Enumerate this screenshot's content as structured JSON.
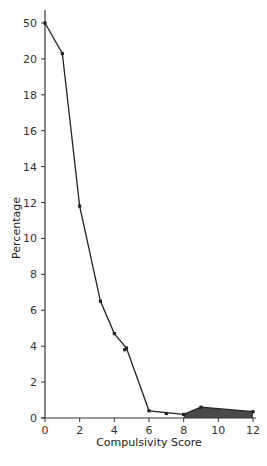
{
  "chart_data": {
    "type": "line",
    "title": "",
    "xlabel": "Compulsivity Score",
    "ylabel": "Percentage",
    "x_ticks": [
      "0",
      "2",
      "4",
      "6",
      "8",
      "10",
      "12"
    ],
    "y_ticks": [
      "0",
      "2",
      "4",
      "6",
      "8",
      "10",
      "12",
      "14",
      "16",
      "18",
      "20",
      "50"
    ],
    "y_axis_note": "broken axis: tick '50' placed one interval above '20'",
    "xlim": [
      0,
      12
    ],
    "ylim": [
      0,
      22
    ],
    "grid": false,
    "legend": null,
    "series": [
      {
        "name": "Percentage",
        "points": [
          {
            "x": 0,
            "y": 50,
            "plot_y": 22
          },
          {
            "x": 1,
            "y": 20.3
          },
          {
            "x": 2,
            "y": 11.8
          },
          {
            "x": 3.2,
            "y": 6.5
          },
          {
            "x": 4,
            "y": 4.7
          },
          {
            "x": 4.7,
            "y": 3.9
          },
          {
            "x": 6,
            "y": 0.4
          },
          {
            "x": 8,
            "y": 0.2
          },
          {
            "x": 9,
            "y": 0.6
          },
          {
            "x": 12,
            "y": 0.35
          }
        ]
      }
    ],
    "extra_markers": [
      {
        "x": 7,
        "y": 0.25
      },
      {
        "x": 4.6,
        "y": 3.8
      }
    ],
    "shaded_region": {
      "x_from": 8,
      "x_to": 12,
      "color": "#4a4a4a",
      "description": "area under curve shaded from score 8 to 12"
    }
  },
  "colors": {
    "line": "#222222",
    "axis": "#333333",
    "shade": "#4a4a4a"
  }
}
